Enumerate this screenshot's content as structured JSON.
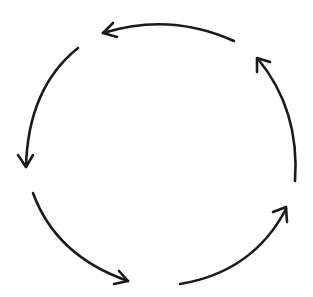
{
  "diagram": {
    "type": "cycle",
    "shape": "circle",
    "direction": "counter-clockwise",
    "segment_count": 5,
    "stroke_color": "#1a1a1a",
    "background_color": "#ffffff",
    "segments": [
      {
        "id": "top",
        "from": [
          234,
          41
        ],
        "to": [
          103,
          33
        ],
        "arrowhead": "at-end"
      },
      {
        "id": "left",
        "from": [
          78,
          48
        ],
        "to": [
          26,
          167
        ],
        "arrowhead": "at-end"
      },
      {
        "id": "bottom-left",
        "from": [
          33,
          193
        ],
        "to": [
          128,
          281
        ],
        "arrowhead": "at-end"
      },
      {
        "id": "bottom-right",
        "from": [
          180,
          284
        ],
        "to": [
          286,
          209
        ],
        "arrowhead": "at-end"
      },
      {
        "id": "right",
        "from": [
          295,
          181
        ],
        "to": [
          258,
          59
        ],
        "arrowhead": "at-end"
      }
    ]
  }
}
